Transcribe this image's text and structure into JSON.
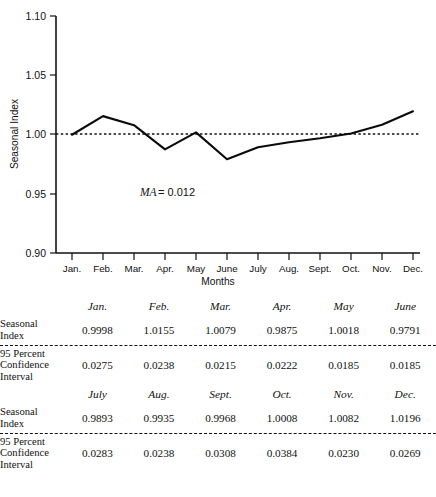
{
  "figure": {
    "axis_title_y": "Seasonal Index",
    "axis_title_x": "Months",
    "annotation_italic": "MA",
    "annotation_roman": "= 0.012",
    "ytick_labels": [
      "1.10",
      "1.05",
      "1.00",
      "0.95",
      "0.90"
    ],
    "months_short": [
      "Jan.",
      "Feb.",
      "Mar.",
      "Apr.",
      "May",
      "June",
      "July",
      "Aug.",
      "Sept.",
      "Oct.",
      "Nov.",
      "Dec."
    ],
    "line_color": "#0b0b0b",
    "reference_value": "1.00"
  },
  "chart_data": {
    "type": "line",
    "title": "",
    "xlabel": "Months",
    "ylabel": "Seasonal Index",
    "categories": [
      "Jan.",
      "Feb.",
      "Mar.",
      "Apr.",
      "May",
      "June",
      "July",
      "Aug.",
      "Sept.",
      "Oct.",
      "Nov.",
      "Dec."
    ],
    "values": [
      0.9998,
      1.0155,
      1.0079,
      0.9875,
      1.0018,
      0.9791,
      0.9893,
      0.9935,
      0.9968,
      1.0008,
      1.0082,
      1.0196
    ],
    "ylim": [
      0.9,
      1.1
    ],
    "yticks": [
      0.9,
      0.95,
      1.0,
      1.05,
      1.1
    ],
    "grid": false,
    "legend": "none",
    "annotations": [
      "MA = 0.012"
    ],
    "reference_line": {
      "y": 1.0,
      "style": "dashed"
    }
  },
  "table": {
    "caption": "Months",
    "blocks": [
      {
        "months": [
          "Jan.",
          "Feb.",
          "Mar.",
          "Apr.",
          "May",
          "June"
        ],
        "seasonal_index_label": "Seasonal\nIndex",
        "seasonal_index_label_line1": "Seasonal",
        "seasonal_index_label_line2": "Index",
        "seasonal_index": [
          "0.9998",
          "1.0155",
          "1.0079",
          "0.9875",
          "1.0018",
          "0.9791"
        ],
        "ci_label_line1": "95 Percent",
        "ci_label_line2": "Confidence",
        "ci_label_line3": "Interval",
        "confidence_interval": [
          "0.0275",
          "0.0238",
          "0.0215",
          "0.0222",
          "0.0185",
          "0.0185"
        ]
      },
      {
        "months": [
          "July",
          "Aug.",
          "Sept.",
          "Oct.",
          "Nov.",
          "Dec."
        ],
        "seasonal_index_label_line1": "Seasonal",
        "seasonal_index_label_line2": "Index",
        "seasonal_index": [
          "0.9893",
          "0.9935",
          "0.9968",
          "1.0008",
          "1.0082",
          "1.0196"
        ],
        "ci_label_line1": "95 Percent",
        "ci_label_line2": "Confidence",
        "ci_label_line3": "Interval",
        "confidence_interval": [
          "0.0283",
          "0.0238",
          "0.0308",
          "0.0384",
          "0.0230",
          "0.0269"
        ]
      }
    ]
  }
}
